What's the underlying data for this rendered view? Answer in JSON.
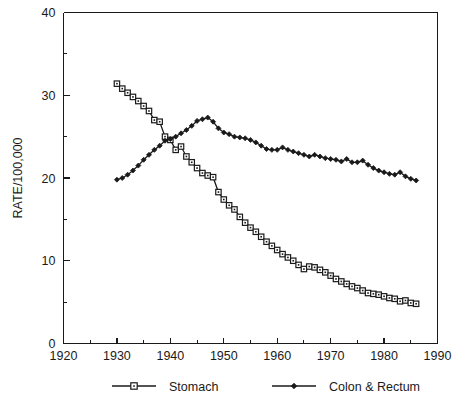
{
  "chart_data": {
    "type": "line",
    "title": "",
    "subtitle": "",
    "xlabel": "",
    "ylabel": "RATE/100,000",
    "xlim": [
      1920,
      1990
    ],
    "ylim": [
      0,
      40
    ],
    "grid": false,
    "legend_position": "bottom",
    "x_ticks_major": [
      1920,
      1930,
      1940,
      1950,
      1960,
      1970,
      1980,
      1990
    ],
    "x_ticks_minor": [
      1925,
      1935,
      1945,
      1955,
      1965,
      1975,
      1985
    ],
    "y_ticks_major": [
      0,
      10,
      20,
      30,
      40
    ],
    "y_ticks_minor": [
      5,
      15,
      25,
      35
    ],
    "x_tick_labels": [
      "1920",
      "1930",
      "1940",
      "1950",
      "1960",
      "1970",
      "1980",
      "1990"
    ],
    "y_tick_labels": [
      "0",
      "10",
      "20",
      "30",
      "40"
    ],
    "x": [
      1930,
      1931,
      1932,
      1933,
      1934,
      1935,
      1936,
      1937,
      1938,
      1939,
      1940,
      1941,
      1942,
      1943,
      1944,
      1945,
      1946,
      1947,
      1948,
      1949,
      1950,
      1951,
      1952,
      1953,
      1954,
      1955,
      1956,
      1957,
      1958,
      1959,
      1960,
      1961,
      1962,
      1963,
      1964,
      1965,
      1966,
      1967,
      1968,
      1969,
      1970,
      1971,
      1972,
      1973,
      1974,
      1975,
      1976,
      1977,
      1978,
      1979,
      1980,
      1981,
      1982,
      1983,
      1984,
      1985,
      1986
    ],
    "series": [
      {
        "name": "Stomach",
        "marker": "open-square",
        "color": "#1a1a1a",
        "values": [
          31.4,
          30.8,
          30.3,
          29.8,
          29.3,
          28.7,
          28.1,
          27.0,
          26.8,
          25.0,
          24.6,
          23.4,
          23.8,
          22.6,
          21.9,
          21.2,
          20.6,
          20.3,
          20.1,
          18.3,
          17.4,
          16.7,
          16.2,
          15.3,
          14.6,
          14.0,
          13.5,
          12.9,
          12.3,
          11.8,
          11.3,
          10.8,
          10.4,
          10.0,
          9.5,
          9.0,
          9.3,
          9.2,
          8.9,
          8.6,
          8.2,
          7.8,
          7.5,
          7.2,
          6.9,
          6.7,
          6.4,
          6.1,
          6.0,
          5.9,
          5.7,
          5.5,
          5.4,
          5.1,
          5.2,
          4.9,
          4.8
        ]
      },
      {
        "name": "Colon & Rectum",
        "marker": "filled-diamond",
        "color": "#1a1a1a",
        "values": [
          19.8,
          20.0,
          20.4,
          20.9,
          21.5,
          22.2,
          22.8,
          23.4,
          23.9,
          24.5,
          24.7,
          25.0,
          25.4,
          25.8,
          26.3,
          26.9,
          27.1,
          27.3,
          26.8,
          26.0,
          25.5,
          25.3,
          25.0,
          24.9,
          24.8,
          24.6,
          24.3,
          23.9,
          23.5,
          23.4,
          23.4,
          23.7,
          23.4,
          23.2,
          23.0,
          22.8,
          22.6,
          22.8,
          22.6,
          22.4,
          22.3,
          22.2,
          22.0,
          22.3,
          21.9,
          21.9,
          22.1,
          21.6,
          21.2,
          20.9,
          20.7,
          20.5,
          20.4,
          20.7,
          20.2,
          19.9,
          19.7
        ]
      }
    ],
    "legend": [
      {
        "label": "Stomach",
        "marker": "open-square"
      },
      {
        "label": "Colon & Rectum",
        "marker": "filled-diamond"
      }
    ]
  }
}
